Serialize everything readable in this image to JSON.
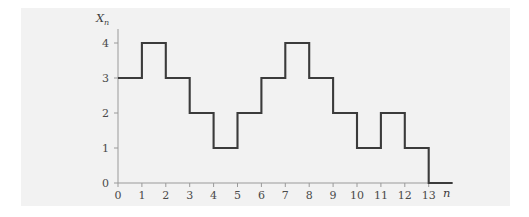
{
  "chart_data": {
    "type": "line",
    "subtype": "step",
    "title": "",
    "xlabel": "n",
    "ylabel": "X_n",
    "ylabel_base": "X",
    "ylabel_sub": "n",
    "x": [
      0,
      1,
      2,
      3,
      4,
      5,
      6,
      7,
      8,
      9,
      10,
      11,
      12,
      13
    ],
    "values": [
      3,
      4,
      3,
      2,
      1,
      2,
      3,
      4,
      3,
      2,
      1,
      2,
      1,
      0
    ],
    "step_intervals": [
      {
        "from": 0,
        "to": 1,
        "value": 3
      },
      {
        "from": 1,
        "to": 2,
        "value": 4
      },
      {
        "from": 2,
        "to": 3,
        "value": 3
      },
      {
        "from": 3,
        "to": 4,
        "value": 2
      },
      {
        "from": 4,
        "to": 5,
        "value": 1
      },
      {
        "from": 5,
        "to": 6,
        "value": 2
      },
      {
        "from": 6,
        "to": 7,
        "value": 3
      },
      {
        "from": 7,
        "to": 8,
        "value": 4
      },
      {
        "from": 8,
        "to": 9,
        "value": 3
      },
      {
        "from": 9,
        "to": 10,
        "value": 2
      },
      {
        "from": 10,
        "to": 11,
        "value": 1
      },
      {
        "from": 11,
        "to": 12,
        "value": 2
      },
      {
        "from": 12,
        "to": 13,
        "value": 1
      },
      {
        "from": 13,
        "to": 14,
        "value": 0
      }
    ],
    "xticks": [
      "0",
      "1",
      "2",
      "3",
      "4",
      "5",
      "6",
      "7",
      "8",
      "9",
      "10",
      "11",
      "12",
      "13"
    ],
    "xtick_values": [
      0,
      1,
      2,
      3,
      4,
      5,
      6,
      7,
      8,
      9,
      10,
      11,
      12,
      13
    ],
    "yticks": [
      "0",
      "1",
      "2",
      "3",
      "4"
    ],
    "ytick_values": [
      0,
      1,
      2,
      3,
      4
    ],
    "xlim": [
      0,
      14
    ],
    "ylim": [
      0,
      4.4
    ],
    "grid": false,
    "legend": null,
    "line_color": "#3b3b3b",
    "axis_color": "#9a9a9a",
    "background_color": "#f2f2f2",
    "page_color": "#ffffff"
  }
}
